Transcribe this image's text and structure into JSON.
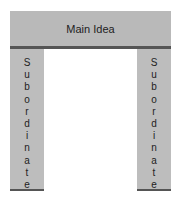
{
  "main": {
    "label": "Main Idea"
  },
  "left_pillar": {
    "label": "Subordinate",
    "letters": [
      "S",
      "u",
      "b",
      "o",
      "r",
      "d",
      "i",
      "n",
      "a",
      "t",
      "e"
    ]
  },
  "right_pillar": {
    "label": "Subordinate",
    "letters": [
      "S",
      "u",
      "b",
      "o",
      "r",
      "d",
      "i",
      "n",
      "a",
      "t",
      "e"
    ]
  },
  "colors": {
    "block": "#b9b9b9",
    "bar": "#555555"
  }
}
